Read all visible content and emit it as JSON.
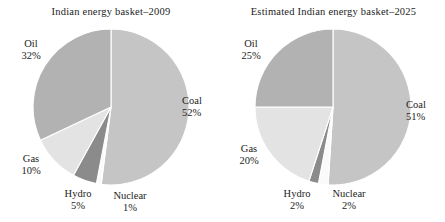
{
  "figure": {
    "background": "#ffffff",
    "text_color": "#1c1c1c"
  },
  "palette": {
    "coal": "#c5c5c5",
    "oil": "#b2b2b2",
    "gas": "#e3e3e3",
    "hydro": "#8b8b8b",
    "nuclear": "#fafafa",
    "edge": "#ffffff"
  },
  "chart_data": [
    {
      "type": "pie",
      "title": "Indian energy basket–2009",
      "categories": [
        "Coal",
        "Nuclear",
        "Hydro",
        "Gas",
        "Oil"
      ],
      "values": [
        52,
        1,
        5,
        10,
        32
      ],
      "value_labels": [
        "52%",
        "1%",
        "5%",
        "10%",
        "32%"
      ],
      "colors": [
        "#c5c5c5",
        "#fafafa",
        "#8b8b8b",
        "#e3e3e3",
        "#b2b2b2"
      ],
      "start_angle_deg": 0,
      "direction": "clockwise",
      "units": "percent",
      "legend": "none",
      "labels_outside": true,
      "slices": [
        {
          "name": "Coal",
          "pct_text": "52%",
          "value": 52
        },
        {
          "name": "Nuclear",
          "pct_text": "1%",
          "value": 1
        },
        {
          "name": "Hydro",
          "pct_text": "5%",
          "value": 5
        },
        {
          "name": "Gas",
          "pct_text": "10%",
          "value": 10
        },
        {
          "name": "Oil",
          "pct_text": "32%",
          "value": 32
        }
      ]
    },
    {
      "type": "pie",
      "title": "Estimated Indian energy basket–2025",
      "categories": [
        "Coal",
        "Nuclear",
        "Hydro",
        "Gas",
        "Oil"
      ],
      "values": [
        51,
        2,
        2,
        20,
        25
      ],
      "value_labels": [
        "51%",
        "2%",
        "2%",
        "20%",
        "25%"
      ],
      "colors": [
        "#c5c5c5",
        "#fafafa",
        "#8b8b8b",
        "#e3e3e3",
        "#b2b2b2"
      ],
      "start_angle_deg": 0,
      "direction": "clockwise",
      "units": "percent",
      "legend": "none",
      "labels_outside": true,
      "slices": [
        {
          "name": "Coal",
          "pct_text": "51%",
          "value": 51
        },
        {
          "name": "Nuclear",
          "pct_text": "2%",
          "value": 2
        },
        {
          "name": "Hydro",
          "pct_text": "2%",
          "value": 2
        },
        {
          "name": "Gas",
          "pct_text": "20%",
          "value": 20
        },
        {
          "name": "Oil",
          "pct_text": "25%",
          "value": 25
        }
      ]
    }
  ]
}
